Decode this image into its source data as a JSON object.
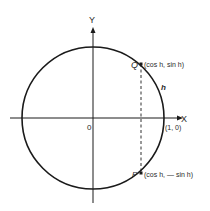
{
  "diagram": {
    "type": "unit-circle",
    "axes": {
      "x_label": "X",
      "y_label": "Y",
      "origin_label": "0"
    },
    "points": {
      "Q": {
        "name": "Q",
        "coords": "(cos h, sin h)"
      },
      "P": {
        "name": "P",
        "coords": "(cos h, — sin h)"
      },
      "unit": {
        "coords": "(1, 0)"
      }
    },
    "arc_label": "h",
    "colors": {
      "stroke": "#1a1a1a",
      "background": "#ffffff"
    }
  }
}
